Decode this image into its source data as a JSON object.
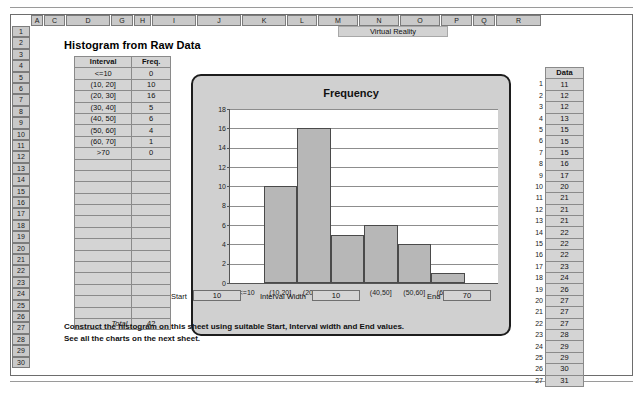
{
  "sheet": {
    "title": "Histogram from Raw Data",
    "merged_header": "Virtual Reality",
    "column_headers": [
      "A",
      "C",
      "D",
      "G",
      "H",
      "I",
      "J",
      "K",
      "L",
      "M",
      "N",
      "O",
      "P",
      "Q",
      "R"
    ],
    "row_headers": [
      "1",
      "2",
      "3",
      "4",
      "5",
      "6",
      "7",
      "8",
      "9",
      "10",
      "11",
      "12",
      "13",
      "14",
      "15",
      "16",
      "17",
      "18",
      "19",
      "20",
      "21",
      "22",
      "23",
      "24",
      "25",
      "26",
      "27",
      "28",
      "29",
      "30"
    ]
  },
  "frequency_table": {
    "headers": [
      "Interval",
      "Freq."
    ],
    "rows": [
      {
        "interval": "<=10",
        "freq": "0"
      },
      {
        "interval": "(10, 20]",
        "freq": "10"
      },
      {
        "interval": "(20, 30]",
        "freq": "16"
      },
      {
        "interval": "(30, 40]",
        "freq": "5"
      },
      {
        "interval": "(40, 50]",
        "freq": "6"
      },
      {
        "interval": "(50, 60]",
        "freq": "4"
      },
      {
        "interval": "(60, 70]",
        "freq": "1"
      },
      {
        "interval": ">70",
        "freq": "0"
      }
    ],
    "blank_row_count": 14,
    "total_label": "Total",
    "total_value": "42"
  },
  "parameters": {
    "start_label": "Start",
    "start_value": "10",
    "interval_width_label": "Interval Width",
    "interval_width_value": "10",
    "end_label": "End",
    "end_value": "70"
  },
  "instructions": {
    "line1": "Construct the histogram on this sheet using suitable Start, Interval width and End values.",
    "line2": "See all the charts on the next sheet."
  },
  "data_column": {
    "header": "Data",
    "indices": [
      "1",
      "2",
      "3",
      "4",
      "5",
      "6",
      "7",
      "8",
      "9",
      "10",
      "11",
      "12",
      "13",
      "14",
      "15",
      "16",
      "17",
      "18",
      "19",
      "20",
      "21",
      "22",
      "23",
      "24",
      "25",
      "26",
      "27"
    ],
    "values": [
      "11",
      "12",
      "12",
      "13",
      "15",
      "15",
      "15",
      "16",
      "17",
      "20",
      "21",
      "21",
      "21",
      "22",
      "22",
      "22",
      "23",
      "24",
      "26",
      "27",
      "27",
      "27",
      "28",
      "29",
      "29",
      "30",
      "31"
    ]
  },
  "colors": {
    "bar_fill": "#b7b7b7",
    "bar_stroke": "#4a4a4a",
    "cell_fill": "#d4d4d4",
    "header_fill": "#c9c9c9",
    "chart_bg": "#d0d0d0"
  },
  "chart_data": {
    "type": "bar",
    "title": "Frequency",
    "xlabel": "",
    "ylabel": "",
    "categories": [
      "<=10",
      "(10,20]",
      "(20,30]",
      "(30,40]",
      "(40,50]",
      "(50,60]",
      "(60,70]",
      ">70"
    ],
    "values": [
      0,
      10,
      16,
      5,
      6,
      4,
      1,
      0
    ],
    "ylim": [
      0,
      18
    ],
    "yticks": [
      0,
      2,
      4,
      6,
      8,
      10,
      12,
      14,
      16,
      18
    ],
    "grid": true,
    "legend": "none"
  }
}
